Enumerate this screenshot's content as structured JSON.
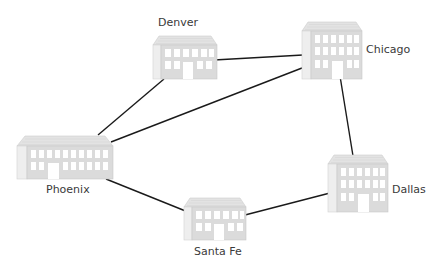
{
  "diagram": {
    "type": "network-map",
    "edge_color": "#1a1a1a",
    "building_colors": {
      "roof": "#e3e3e3",
      "front": "#dcdcdc",
      "side": "#eeeeee",
      "window": "#ffffff",
      "outline": "#c8c8c8"
    },
    "nodes": [
      {
        "id": "denver",
        "label": "Denver",
        "building": "small"
      },
      {
        "id": "chicago",
        "label": "Chicago",
        "building": "tall"
      },
      {
        "id": "phoenix",
        "label": "Phoenix",
        "building": "wide"
      },
      {
        "id": "dallas",
        "label": "Dallas",
        "building": "tall"
      },
      {
        "id": "santafe",
        "label": "Santa Fe",
        "building": "small"
      }
    ],
    "edges": [
      {
        "from": "Denver",
        "to": "Chicago"
      },
      {
        "from": "Denver",
        "to": "Phoenix"
      },
      {
        "from": "Phoenix",
        "to": "Chicago"
      },
      {
        "from": "Chicago",
        "to": "Dallas"
      },
      {
        "from": "Phoenix",
        "to": "Santa Fe"
      },
      {
        "from": "Santa Fe",
        "to": "Dallas"
      }
    ]
  }
}
